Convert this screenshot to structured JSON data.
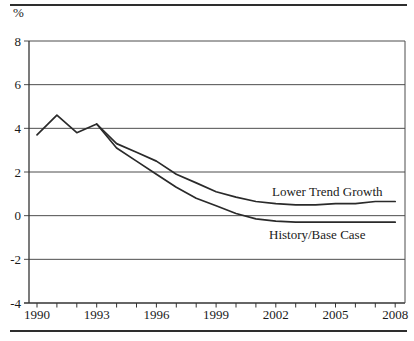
{
  "chart_data": {
    "type": "line",
    "title": "",
    "xlabel": "",
    "ylabel": "%",
    "ylim": [
      -4,
      8
    ],
    "yticks": [
      8,
      6,
      4,
      2,
      0,
      -2,
      -4
    ],
    "ytick_labels": [
      "8",
      "6",
      "4",
      "2",
      "0",
      "-2",
      "-4"
    ],
    "x": [
      1990,
      1991,
      1992,
      1993,
      1994,
      1995,
      1996,
      1997,
      1998,
      1999,
      2000,
      2001,
      2002,
      2003,
      2004,
      2005,
      2006,
      2007,
      2008
    ],
    "xtick_labels": [
      "1990",
      "1993",
      "1996",
      "1999",
      "2002",
      "2005",
      "2008"
    ],
    "minor_xticks": "every year",
    "grid": "horizontal",
    "legend": "inline annotations on chart",
    "series": [
      {
        "name": "History/Base Case",
        "values": [
          3.7,
          4.6,
          3.8,
          4.2,
          3.1,
          2.5,
          1.9,
          1.3,
          0.8,
          0.45,
          0.1,
          -0.15,
          -0.25,
          -0.3,
          -0.3,
          -0.3,
          -0.3,
          -0.3,
          -0.3
        ]
      },
      {
        "name": "Lower Trend Growth",
        "values": [
          null,
          null,
          null,
          4.2,
          3.3,
          2.9,
          2.5,
          1.9,
          1.5,
          1.1,
          0.85,
          0.65,
          0.55,
          0.5,
          0.5,
          0.55,
          0.55,
          0.65,
          0.65
        ]
      }
    ],
    "colors": {
      "line": "#2a2a2a",
      "grid": "#4d4d4d",
      "axis": "#333333",
      "text": "#1a1a1a"
    }
  }
}
